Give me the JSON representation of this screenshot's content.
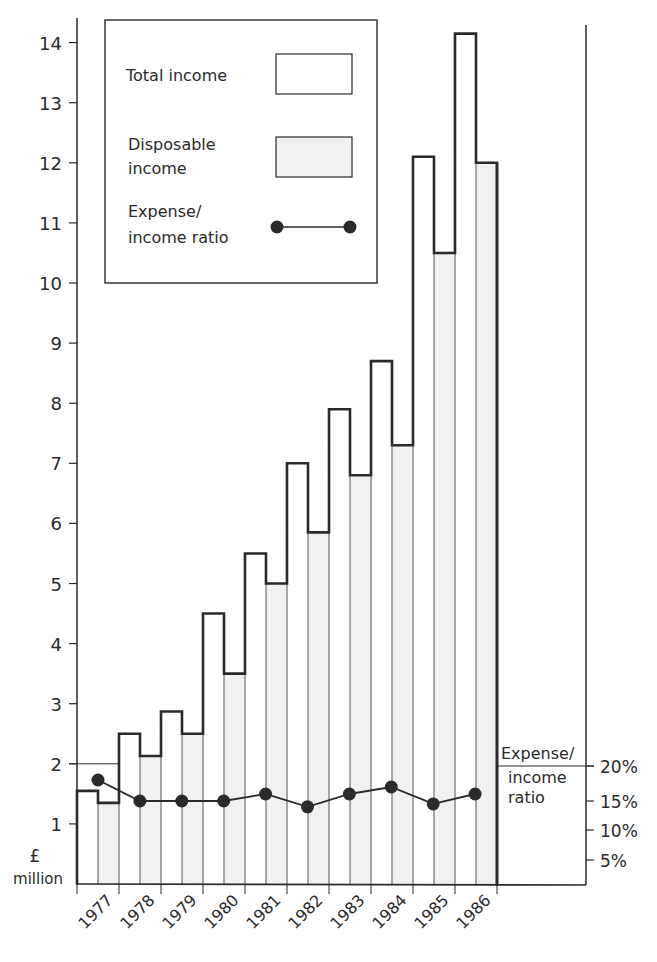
{
  "chart_data": {
    "type": "bar",
    "title": "",
    "xlabel": "",
    "ylabel": "£ million",
    "ylabel_lines": [
      "£",
      "million"
    ],
    "ylim": [
      0,
      14
    ],
    "yticks": [
      1,
      2,
      3,
      4,
      5,
      6,
      7,
      8,
      9,
      10,
      11,
      12,
      13,
      14
    ],
    "categories": [
      "1977",
      "1978",
      "1979",
      "1980",
      "1981",
      "1982",
      "1983",
      "1984",
      "1985",
      "1986"
    ],
    "series": [
      {
        "name": "Total income",
        "type": "bar",
        "axis": "left",
        "values": [
          1.55,
          2.5,
          2.87,
          4.5,
          5.5,
          7.0,
          7.9,
          8.7,
          12.1,
          14.15
        ]
      },
      {
        "name": "Disposable income",
        "type": "bar",
        "axis": "left",
        "values": [
          1.35,
          2.13,
          2.5,
          3.5,
          5.0,
          5.85,
          6.8,
          7.3,
          10.5,
          12.0
        ]
      },
      {
        "name": "Expense/income ratio",
        "type": "line",
        "axis": "right",
        "unit": "%",
        "values": [
          18,
          15,
          15,
          15,
          16,
          14,
          16,
          17,
          14.5,
          16
        ]
      }
    ],
    "secondary_axis": {
      "label_lines": [
        "Expense/",
        "income",
        "ratio"
      ],
      "ylim": [
        0,
        20
      ],
      "ticks": [
        {
          "value": 20,
          "label": "20%"
        },
        {
          "value": 15,
          "label": "15%"
        },
        {
          "value": 10,
          "label": "10%"
        },
        {
          "value": 5,
          "label": "5%"
        }
      ]
    },
    "legend": {
      "position": "top-left-inside",
      "entries": [
        {
          "label_lines": [
            "Total income"
          ],
          "swatch": "white-box"
        },
        {
          "label_lines": [
            "Disposable",
            "income"
          ],
          "swatch": "shaded-box"
        },
        {
          "label_lines": [
            "Expense/",
            "income ratio"
          ],
          "swatch": "line-dots"
        }
      ]
    },
    "grid": false
  },
  "colors": {
    "ink": "#2a2a2a",
    "disposable_fill": "#f1f1f1",
    "total_fill": "#ffffff"
  }
}
